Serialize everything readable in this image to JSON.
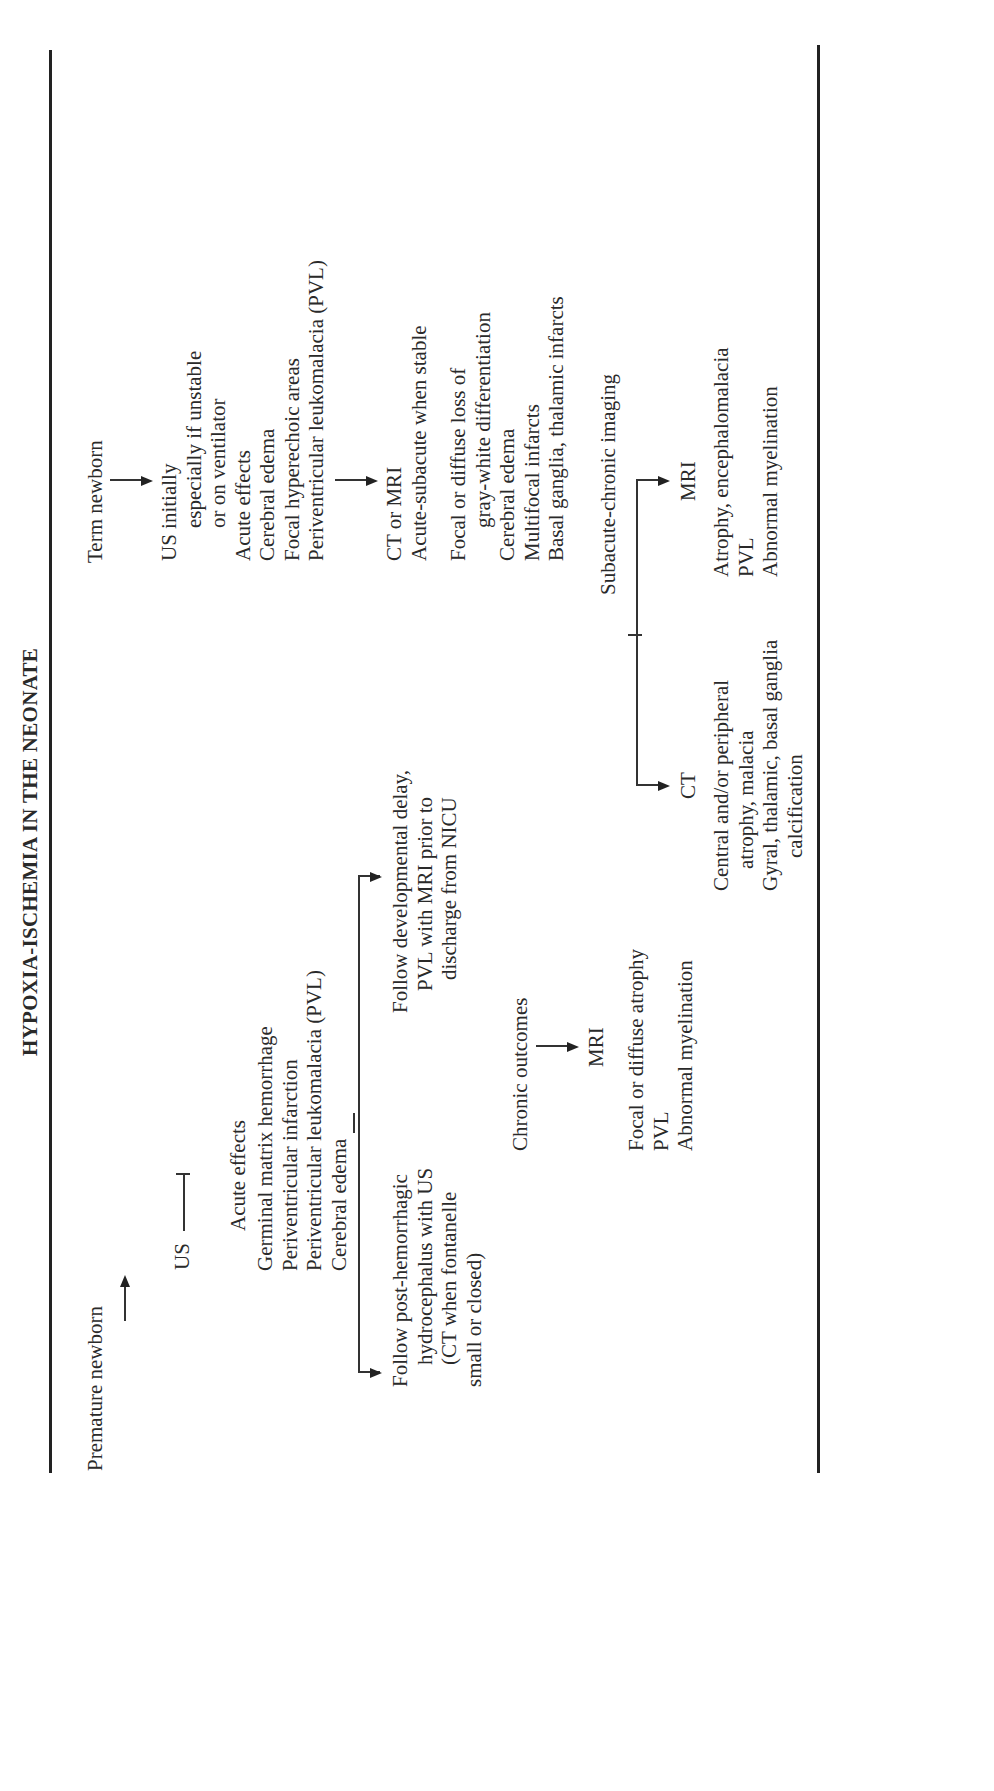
{
  "title": "HYPOXIA-ISCHEMIA IN THE NEONATE",
  "premature": {
    "start": "Premature newborn",
    "us": "US",
    "acute_header": "Acute effects",
    "acute_items": [
      "Germinal matrix hemorrhage",
      "Periventricular infarction",
      "Periventricular leukomalacia (PVL)",
      "Cerebral edema"
    ],
    "branch_left": [
      "Follow post-hemorrhagic",
      "hydrocephalus with US",
      "(CT when fontanelle",
      "small or closed)"
    ],
    "branch_right": [
      "Follow developmental delay,",
      "PVL with MRI prior to",
      "discharge from NICU"
    ],
    "chronic": "Chronic outcomes",
    "mri": "MRI",
    "mri_items": [
      "Focal or diffuse atrophy",
      "PVL",
      "Abnormal myelination"
    ]
  },
  "term": {
    "start": "Term newborn",
    "us_lines": [
      "US initially",
      "especially if unstable",
      "or on ventilator"
    ],
    "acute_header": "Acute effects",
    "acute_items": [
      "Cerebral edema",
      "Focal hyperechoic areas",
      "Periventricular leukomalacia (PVL)"
    ],
    "ctmri": "CT or MRI",
    "ctmri_sub": "Acute-subacute when stable",
    "findings": [
      "Focal or diffuse loss of",
      "gray-white differentiation",
      "Cerebral edema",
      "Multifocal infarcts",
      "Basal ganglia, thalamic infarcts"
    ],
    "subacute": "Subacute-chronic imaging",
    "ct_label": "CT",
    "ct_items": [
      "Central and/or peripheral",
      "atrophy, malacia",
      "Gyral, thalamic, basal ganglia",
      "calcification"
    ],
    "mri_label": "MRI",
    "mri_items": [
      "Atrophy, encephalomalacia",
      "PVL",
      "Abnormal myelination"
    ]
  }
}
